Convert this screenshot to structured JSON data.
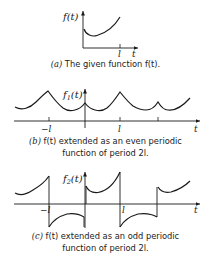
{
  "figure": {
    "panel_a": {
      "y_label": "f(t)",
      "x_label": "t",
      "tick_l": "l",
      "caption_tag": "(a)",
      "caption_text": "The given function f(t)."
    },
    "panel_b": {
      "y_label": "f",
      "y_label_sub": "1",
      "y_label_rest": "(t)",
      "x_label": "t",
      "tick_neg_l": "−l",
      "tick_l": "l",
      "caption_tag": "(b)",
      "caption_line1": "f(t) extended as an even periodic",
      "caption_line2": "function of period 2l."
    },
    "panel_c": {
      "y_label": "f",
      "y_label_sub": "2",
      "y_label_rest": "(t)",
      "x_label": "t",
      "tick_neg_l": "−l",
      "tick_l": "l",
      "caption_tag": "(c)",
      "caption_line1": "f(t) extended as an odd periodic",
      "caption_line2": "function of period 2l."
    }
  }
}
